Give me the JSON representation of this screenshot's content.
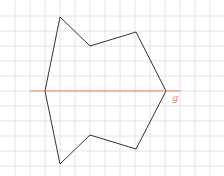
{
  "diagram": {
    "grid": {
      "spacing": 15,
      "x_start": 15,
      "y_start": 16,
      "color": "#e4e4e4"
    },
    "shape": {
      "stroke": "#333333",
      "points": [
        [
          60,
          17
        ],
        [
          90,
          46
        ],
        [
          136,
          32
        ],
        [
          166,
          91
        ],
        [
          136,
          149
        ],
        [
          90,
          135
        ],
        [
          60,
          164
        ],
        [
          45,
          91
        ]
      ]
    },
    "axis_line": {
      "x1": 30,
      "y1": 91,
      "x2": 181,
      "y2": 91,
      "color": "#f08050"
    },
    "label": {
      "text": "g",
      "x": 172,
      "y": 101,
      "color": "#f08050"
    }
  }
}
